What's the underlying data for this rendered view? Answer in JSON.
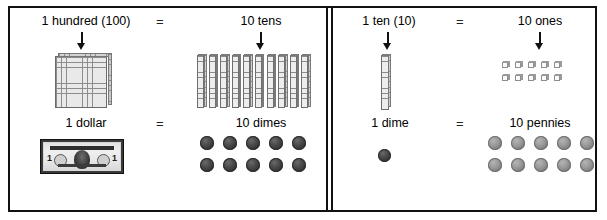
{
  "diagram": {
    "equals_sign": "=",
    "panels": [
      {
        "id": "left",
        "rows": [
          {
            "id": "hundred-tens",
            "left_label": "1 hundred (100)",
            "operator": "=",
            "right_label": "10 tens",
            "left_manipulative": "hundred-flat",
            "right_manipulative": "ten-rods",
            "right_count": 10,
            "arrow_left": "down-arrow",
            "arrow_right": "down-arrow"
          },
          {
            "id": "dollar-dimes",
            "left_label": "1 dollar",
            "operator": "=",
            "right_label": "10 dimes",
            "left_manipulative": "dollar-bill",
            "right_manipulative": "dime-coins",
            "right_count": 10,
            "right_rows": [
              5,
              5
            ]
          }
        ]
      },
      {
        "id": "right",
        "rows": [
          {
            "id": "ten-ones",
            "left_label": "1 ten (10)",
            "operator": "=",
            "right_label": "10 ones",
            "left_manipulative": "ten-rod",
            "right_manipulative": "unit-cubes",
            "right_count": 10,
            "right_rows": [
              5,
              5
            ],
            "arrow_left": "down-arrow",
            "arrow_right": "down-arrow"
          },
          {
            "id": "dime-pennies",
            "left_label": "1 dime",
            "operator": "=",
            "right_label": "10 pennies",
            "left_manipulative": "dime-coin",
            "right_manipulative": "penny-coins",
            "right_count": 10,
            "right_rows": [
              5,
              5
            ]
          }
        ]
      }
    ],
    "bill": {
      "denomination": "1",
      "country_line": "THE UNITED STATES OF AMERICA",
      "bottom_line": "ONE DOLLAR"
    },
    "colors": {
      "border": "#111111",
      "block_fill": "#e9e9e9",
      "block_line": "#8d8d8d",
      "dime": "#343434",
      "penny": "#9a9a9a",
      "background": "#ffffff"
    }
  }
}
